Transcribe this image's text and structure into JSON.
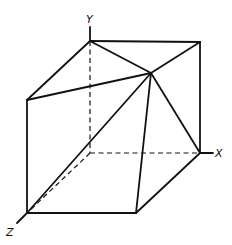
{
  "figure": {
    "title": "",
    "colors": {
      "line": "#111111",
      "background": "#ffffff"
    }
  },
  "axes": {
    "x": {
      "label": "X"
    },
    "y": {
      "label": "Y"
    },
    "z": {
      "label": "Z"
    }
  },
  "vertices": {
    "A_top_back_left": [
      90,
      41
    ],
    "B_top_back_right": [
      200,
      42
    ],
    "C_top_front_left": [
      27,
      100
    ],
    "P_apex": [
      151,
      73
    ],
    "D_origin_hidden": [
      90,
      153
    ],
    "E_bottom_back_right": [
      200,
      153
    ],
    "F_bottom_front_left": [
      27,
      213
    ],
    "G_bottom_front_right": [
      136,
      213
    ]
  },
  "edges": {
    "solid": [
      [
        "A",
        "B"
      ],
      [
        "A",
        "C"
      ],
      [
        "A",
        "P"
      ],
      [
        "B",
        "P"
      ],
      [
        "B",
        "E"
      ],
      [
        "C",
        "P"
      ],
      [
        "C",
        "F"
      ],
      [
        "P",
        "F"
      ],
      [
        "P",
        "G"
      ],
      [
        "P",
        "E"
      ],
      [
        "F",
        "G"
      ],
      [
        "G",
        "E"
      ]
    ],
    "hidden": [
      [
        "A",
        "D"
      ],
      [
        "D",
        "E"
      ],
      [
        "D",
        "F"
      ]
    ]
  }
}
